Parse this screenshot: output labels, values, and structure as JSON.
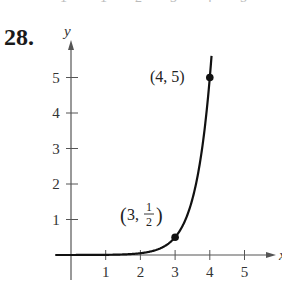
{
  "problem": {
    "number": "28."
  },
  "top_cutoff_ticks": [
    "1",
    "1",
    "2",
    "3",
    "4",
    "5"
  ],
  "chart_data": {
    "type": "line",
    "title": "",
    "xlabel": "x",
    "ylabel": "y",
    "xlim": [
      -1.3,
      6.2
    ],
    "ylim": [
      -0.3,
      5.6
    ],
    "x_ticks": [
      "1",
      "2",
      "3",
      "4",
      "5"
    ],
    "y_ticks": [
      "1",
      "2",
      "3",
      "4",
      "5"
    ],
    "grid": false,
    "legend": null,
    "function": "y = (1/2)·10^(x−3)",
    "series": [
      {
        "name": "curve",
        "x": [
          -1.3,
          0,
          1,
          2,
          2.5,
          3,
          3.3,
          3.6,
          3.8,
          4,
          4.05
        ],
        "y": [
          3e-05,
          0.0005,
          0.005,
          0.05,
          0.158,
          0.5,
          1.0,
          1.99,
          3.15,
          5.0,
          5.6
        ]
      }
    ],
    "annotations": [
      {
        "point": [
          3,
          0.5
        ],
        "label": "(3, 1/2)",
        "label_text": {
          "open": "(3, ",
          "num": "1",
          "den": "2",
          "close": ")"
        }
      },
      {
        "point": [
          4,
          5
        ],
        "label": "(4, 5)"
      }
    ]
  }
}
